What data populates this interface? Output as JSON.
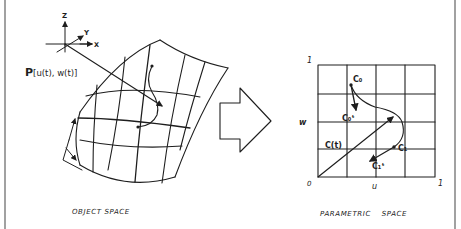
{
  "figure": {
    "frame_color": "#8a8a8a",
    "ink_color": "#1e1e1e",
    "object_space": {
      "caption": "OBJECT SPACE",
      "axes": {
        "z": "Z",
        "y": "Y",
        "x": "X"
      },
      "point_label_bold": "P",
      "point_label_args": "[u(t), w(t)]"
    },
    "transform_arrow": {
      "icon": "right-arrow-icon"
    },
    "parametric_space": {
      "caption": "PARAMETRIC SPACE",
      "axis_labels": {
        "u": "u",
        "w": "w"
      },
      "tick_labels": {
        "origin": "0",
        "u_max": "1",
        "w_max": "1"
      },
      "curve_labels": {
        "c0": "C₀",
        "c0_tangent": "C₀ᵗ",
        "c_t": "C(t)",
        "c1": "C₁",
        "c1_tangent": "C₁ᵗ"
      },
      "grid": {
        "rows": 4,
        "cols": 4
      }
    }
  }
}
